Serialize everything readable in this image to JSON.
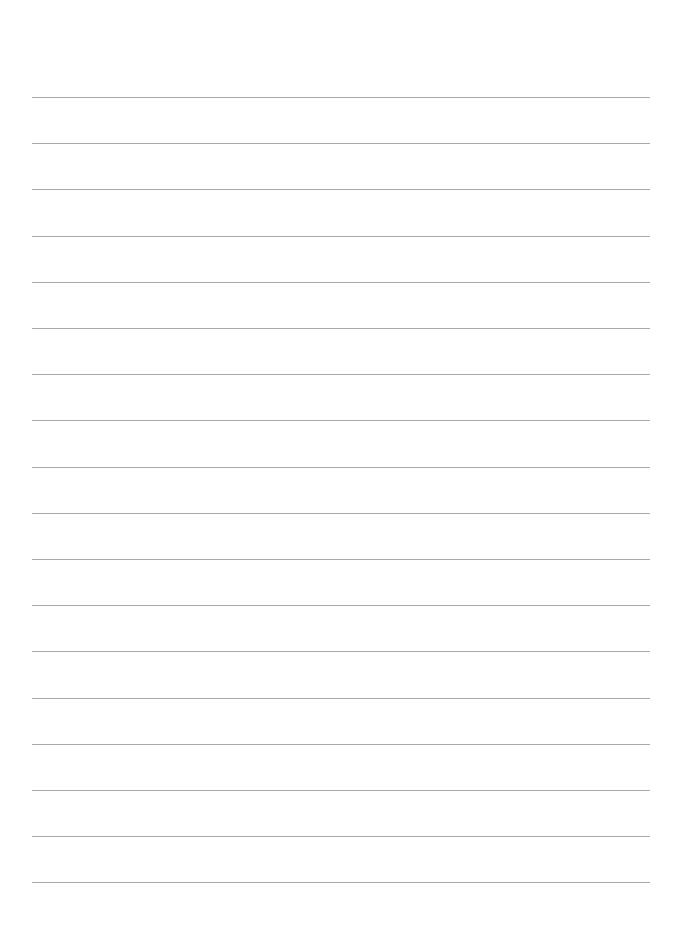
{
  "page": {
    "type": "lined-paper",
    "background_color": "#ffffff",
    "line_color": "#a9a9a9",
    "line_count": 18,
    "line_left": 32,
    "line_right": 650,
    "first_line_y": 97,
    "line_spacing": 46.2,
    "text": ""
  }
}
